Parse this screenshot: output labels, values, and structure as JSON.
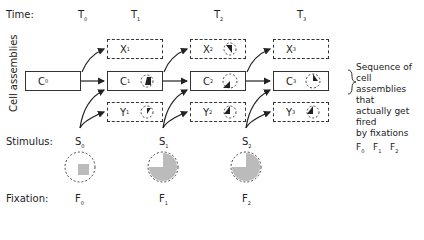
{
  "row_labels": {
    "time": "Time:",
    "stimulus": "Stimulus:",
    "fixation": "Fixation:",
    "cell_assemblies": "Cell assemblies"
  },
  "times": [
    "T",
    "T",
    "T",
    "T"
  ],
  "time_subs": [
    "0",
    "1",
    "2",
    "3"
  ],
  "c0": {
    "label": "C",
    "sub": "0"
  },
  "columns": [
    {
      "x": {
        "label": "X",
        "sub": "1"
      },
      "c": {
        "label": "C",
        "sub": "1"
      },
      "y": {
        "label": "Y",
        "sub": "1"
      }
    },
    {
      "x": {
        "label": "X",
        "sub": "2"
      },
      "c": {
        "label": "C",
        "sub": "2"
      },
      "y": {
        "label": "Y",
        "sub": "2"
      }
    },
    {
      "x": {
        "label": "X",
        "sub": "3"
      },
      "c": {
        "label": "C",
        "sub": "3"
      },
      "y": {
        "label": "Y",
        "sub": "3"
      }
    }
  ],
  "stimuli": [
    {
      "label": "S",
      "sub": "0"
    },
    {
      "label": "S",
      "sub": "1"
    },
    {
      "label": "S",
      "sub": "2"
    }
  ],
  "fixations": [
    {
      "label": "F",
      "sub": "0"
    },
    {
      "label": "F",
      "sub": "1"
    },
    {
      "label": "F",
      "sub": "2"
    }
  ],
  "note": {
    "line1": "Sequence of cell",
    "line2": "assemblies that",
    "line3": "actually get fired",
    "line4": "by fixations",
    "seq": [
      "F",
      "F",
      "F"
    ],
    "seq_subs": [
      "0",
      "1",
      "2"
    ]
  }
}
